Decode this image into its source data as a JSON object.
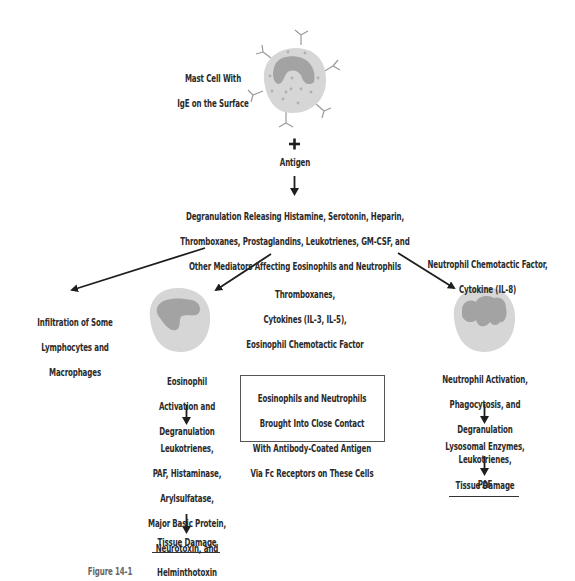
{
  "figure": {
    "caption_partial": "Figure 14-1",
    "colors": {
      "cell_fill": "#d6d6d6",
      "nucleus_fill": "#a3a3a3",
      "granule": "#b0b0b0",
      "antibody": "#9a9a9a",
      "arrow": "#1e1e1e",
      "text": "#2a2a2a"
    }
  },
  "mast_cell": {
    "label_lines": [
      "Mast Cell With",
      "IgE on the Surface"
    ],
    "icon": "mast-cell-with-ige-icon"
  },
  "antigen": {
    "plus": "+",
    "label": "Antigen"
  },
  "degranulation": {
    "lines": [
      "Degranulation Releasing Histamine, Serotonin, Heparin,",
      "Thromboxanes, Prostaglandins, Leukotrienes, GM-CSF, and",
      "Other Mediators Affecting Eosinophils and Neutrophils"
    ]
  },
  "left_branch": {
    "lines": [
      "Infiltration of Some",
      "Lymphocytes and",
      "Macrophages"
    ]
  },
  "eosinophil_branch": {
    "mediators_lines": [
      "Thromboxanes,",
      "Cytokines (IL-3, IL-5),",
      "Eosinophil Chemotactic Factor"
    ],
    "icon": "eosinophil-cell-icon",
    "activation_lines": [
      "Eosinophil",
      "Activation and",
      "Degranulation"
    ],
    "products_lines": [
      "Leukotrienes,",
      "PAF, Histaminase,",
      "Arylsulfatase,",
      "Major Basic Protein,",
      "Neurotoxin, and",
      "Helminthotoxin"
    ],
    "outcome": "Tissue Damage"
  },
  "neutrophil_branch": {
    "mediators_lines": [
      "Neutrophil Chemotactic Factor,",
      "Cytokine (IL-8)"
    ],
    "icon": "neutrophil-cell-icon",
    "activation_lines": [
      "Neutrophil Activation,",
      "Phagocytosis, and",
      "Degranulation"
    ],
    "products_lines": [
      "Lysosomal Enzymes, Leukotrienes,",
      "PAF"
    ],
    "outcome": "Tissue Damage"
  },
  "center_box": {
    "lines": [
      "Eosinophils and Neutrophils",
      "Brought Into Close Contact",
      "With Antibody-Coated Antigen",
      "Via Fc Receptors on These Cells"
    ]
  }
}
